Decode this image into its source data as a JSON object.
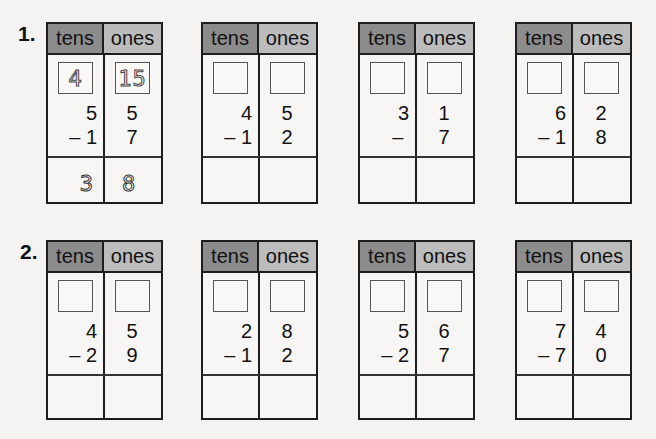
{
  "colors": {
    "tens_header": "#8c8c8c",
    "ones_header": "#bcbcbc",
    "border": "#1e1e1e",
    "background": "#f4f3f1"
  },
  "columns": {
    "tens": "tens",
    "ones": "ones"
  },
  "problems": [
    {
      "label": "1.",
      "items": [
        {
          "regroup_tens": "4",
          "regroup_ones": "15",
          "top_tens": "5",
          "top_ones": "5",
          "operator": "–",
          "bottom_tens": "1",
          "bottom_ones": "7",
          "answer_tens": "3",
          "answer_ones": "8"
        },
        {
          "regroup_tens": "",
          "regroup_ones": "",
          "top_tens": "4",
          "top_ones": "5",
          "operator": "–",
          "bottom_tens": "1",
          "bottom_ones": "2",
          "answer_tens": "",
          "answer_ones": ""
        },
        {
          "regroup_tens": "",
          "regroup_ones": "",
          "top_tens": "3",
          "top_ones": "1",
          "operator": "–",
          "bottom_tens": "",
          "bottom_ones": "7",
          "answer_tens": "",
          "answer_ones": ""
        },
        {
          "regroup_tens": "",
          "regroup_ones": "",
          "top_tens": "6",
          "top_ones": "2",
          "operator": "–",
          "bottom_tens": "1",
          "bottom_ones": "8",
          "answer_tens": "",
          "answer_ones": ""
        }
      ]
    },
    {
      "label": "2.",
      "items": [
        {
          "regroup_tens": "",
          "regroup_ones": "",
          "top_tens": "4",
          "top_ones": "5",
          "operator": "–",
          "bottom_tens": "2",
          "bottom_ones": "9",
          "answer_tens": "",
          "answer_ones": ""
        },
        {
          "regroup_tens": "",
          "regroup_ones": "",
          "top_tens": "2",
          "top_ones": "8",
          "operator": "–",
          "bottom_tens": "1",
          "bottom_ones": "2",
          "answer_tens": "",
          "answer_ones": ""
        },
        {
          "regroup_tens": "",
          "regroup_ones": "",
          "top_tens": "5",
          "top_ones": "6",
          "operator": "–",
          "bottom_tens": "2",
          "bottom_ones": "7",
          "answer_tens": "",
          "answer_ones": ""
        },
        {
          "regroup_tens": "",
          "regroup_ones": "",
          "top_tens": "7",
          "top_ones": "4",
          "operator": "–",
          "bottom_tens": "7",
          "bottom_ones": "0",
          "answer_tens": "",
          "answer_ones": ""
        }
      ]
    }
  ]
}
